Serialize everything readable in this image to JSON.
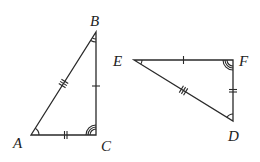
{
  "diagram": {
    "triangles": [
      {
        "name": "triangle-abc",
        "vertices": [
          {
            "label": "A",
            "x": 31,
            "y": 135,
            "label_x": 13,
            "label_y": 148
          },
          {
            "label": "B",
            "x": 96,
            "y": 32,
            "label_x": 90,
            "label_y": 26
          },
          {
            "label": "C",
            "x": 96,
            "y": 135,
            "label_x": 101,
            "label_y": 151
          }
        ]
      },
      {
        "name": "triangle-efd",
        "vertices": [
          {
            "label": "E",
            "x": 134,
            "y": 60,
            "label_x": 113,
            "label_y": 66
          },
          {
            "label": "F",
            "x": 233,
            "y": 60,
            "label_x": 239,
            "label_y": 66
          },
          {
            "label": "D",
            "x": 233,
            "y": 121,
            "label_x": 228,
            "label_y": 141
          }
        ]
      }
    ],
    "side_marks": [
      {
        "side": "AB",
        "ticks": 3
      },
      {
        "side": "BC",
        "ticks": 1
      },
      {
        "side": "AC",
        "ticks": 2
      },
      {
        "side": "ED",
        "ticks": 3
      },
      {
        "side": "EF",
        "ticks": 1
      },
      {
        "side": "FD",
        "ticks": 2
      }
    ],
    "angle_marks": [
      {
        "vertex": "A",
        "arcs": 1
      },
      {
        "vertex": "B",
        "arcs": 2
      },
      {
        "vertex": "C",
        "arcs": 3
      },
      {
        "vertex": "E",
        "arcs": 1
      },
      {
        "vertex": "F",
        "arcs": 3
      },
      {
        "vertex": "D",
        "arcs": 2
      }
    ]
  }
}
